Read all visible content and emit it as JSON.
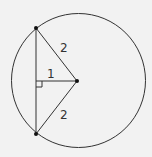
{
  "diagram": {
    "type": "geometry",
    "circle": {
      "cx": 78.5,
      "cy": 80.5,
      "r": 67
    },
    "center": {
      "x": 77,
      "y": 81
    },
    "chord_top": {
      "x": 36,
      "y": 28
    },
    "chord_bottom": {
      "x": 36,
      "y": 134
    },
    "foot": {
      "x": 36,
      "y": 81
    },
    "labels": {
      "radius_top": "2",
      "perpendicular": "1",
      "radius_bottom": "2"
    },
    "colors": {
      "stroke": "#333333",
      "background": "#f2f2f2"
    }
  }
}
